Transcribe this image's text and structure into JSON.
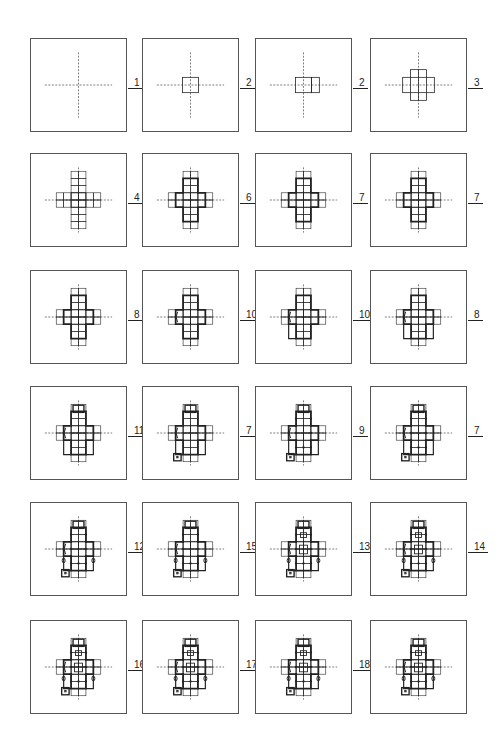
{
  "diagram": {
    "type": "sequence-of-plan-diagrams",
    "stroke_color": "#222222",
    "frame_color": "#555555",
    "panels": [
      {
        "row": 0,
        "col": 0,
        "label": "1",
        "stage": "axes"
      },
      {
        "row": 0,
        "col": 1,
        "label": "2",
        "stage": "single-square"
      },
      {
        "row": 0,
        "col": 2,
        "label": "2",
        "stage": "double-square"
      },
      {
        "row": 0,
        "col": 3,
        "label": "3",
        "stage": "small-cross"
      },
      {
        "row": 1,
        "col": 0,
        "label": "4",
        "stage": "grid-cross"
      },
      {
        "row": 1,
        "col": 1,
        "label": "6",
        "stage": "bold-cross"
      },
      {
        "row": 1,
        "col": 2,
        "label": "7",
        "stage": "bold-cross-transept"
      },
      {
        "row": 1,
        "col": 3,
        "label": "7",
        "stage": "bold-cross-nave"
      },
      {
        "row": 2,
        "col": 0,
        "label": "8",
        "stage": "cross-walls"
      },
      {
        "row": 2,
        "col": 1,
        "label": "10",
        "stage": "cross-apse"
      },
      {
        "row": 2,
        "col": 2,
        "label": "10",
        "stage": "cross-aisle"
      },
      {
        "row": 2,
        "col": 3,
        "label": "8",
        "stage": "cross-aisles"
      },
      {
        "row": 3,
        "col": 0,
        "label": "11",
        "stage": "choir"
      },
      {
        "row": 3,
        "col": 1,
        "label": "7",
        "stage": "choir-tower"
      },
      {
        "row": 3,
        "col": 2,
        "label": "9",
        "stage": "piers"
      },
      {
        "row": 3,
        "col": 3,
        "label": "7",
        "stage": "piers-choir"
      },
      {
        "row": 4,
        "col": 0,
        "label": "12",
        "stage": "columns"
      },
      {
        "row": 4,
        "col": 1,
        "label": "15",
        "stage": "columns-2"
      },
      {
        "row": 4,
        "col": 2,
        "label": "13",
        "stage": "crossing"
      },
      {
        "row": 4,
        "col": 3,
        "label": "14",
        "stage": "crossing-2"
      },
      {
        "row": 5,
        "col": 0,
        "label": "16",
        "stage": "detailed"
      },
      {
        "row": 5,
        "col": 1,
        "label": "17",
        "stage": "detailed-2"
      },
      {
        "row": 5,
        "col": 2,
        "label": "18",
        "stage": "detailed-3"
      },
      {
        "row": 5,
        "col": 3,
        "label": "",
        "stage": "final-plan"
      }
    ]
  }
}
